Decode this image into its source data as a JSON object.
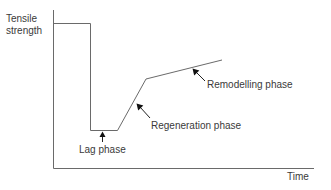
{
  "diagram": {
    "title": "",
    "y_axis_label_line1": "Tensile",
    "y_axis_label_line2": "strength",
    "x_axis_label": "Time",
    "phases": [
      {
        "name": "lag",
        "label": "Lag phase"
      },
      {
        "name": "regeneration",
        "label": "Regeneration phase"
      },
      {
        "name": "remodelling",
        "label": "Remodelling phase"
      }
    ],
    "colors": {
      "line": "#6a6a6a",
      "arrow": "#111111",
      "text": "#3a3a3a",
      "background": "#ffffff"
    }
  }
}
